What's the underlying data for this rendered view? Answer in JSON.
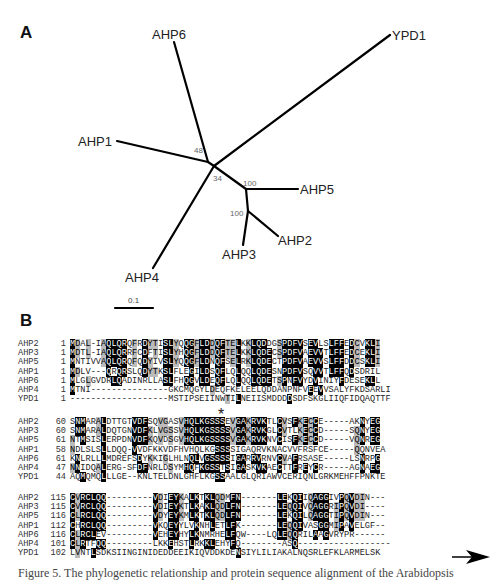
{
  "panel_a": {
    "label": "A",
    "leaves": [
      "AHP6",
      "YPD1",
      "AHP1",
      "AHP5",
      "AHP2",
      "AHP3",
      "AHP4"
    ],
    "bootstrap": [
      "48",
      "34",
      "100",
      "100"
    ],
    "scale_bar": "0.1"
  },
  "panel_b": {
    "label": "B",
    "conserved_marker": "*",
    "blocks": [
      {
        "rows": [
          {
            "name": "AHP2",
            "start": "1",
            "seq": "MDAL-IAQLQRQFRDYTISLYQQGFLDDQFTELKKLQDDGSPDFVSEVLSLFFEDCVKLI"
          },
          {
            "name": "AHP3",
            "start": "1",
            "seq": "MDTL-IAQLQRRFCDFTISLYHQGFLDDQFTELKKLQDECSPDFVAEVVTLFFEDCEKLI"
          },
          {
            "name": "AHP5",
            "start": "1",
            "seq": "MNTIVVAQLQRQFQDYIVSLYQQGFLDNQFSELRKLQDECTPDFVAEVVSLFFDDCSKLI"
          },
          {
            "name": "AHP1",
            "start": "1",
            "seq": "MDLV---QRQRSLQDYTKSLFLEGILDSQFLQLQQLQDESNPDFVSQVVTLFFQDSDRIL"
          },
          {
            "name": "AHP6",
            "start": "1",
            "seq": "MLGLGVDRLQADINRLLASLFHQGVLDEQFLQLQQLQDETSPNFVYDVINIYFDESEKLL"
          },
          {
            "name": "AHP4",
            "start": "1",
            "seq": "MTNI---------------GKCMQGYLDEQFKELEELQDDANPNFVEEVVSALYFKDSARLI"
          },
          {
            "name": "YPD1",
            "start": "1",
            "seq": "-------------------MSTIPSEIINWTILNEIISMDDDDSDFSKGLIIQFIDQAQTTF"
          }
        ]
      },
      {
        "rows": [
          {
            "name": "AHP2",
            "start": "60",
            "seq": "SNMARALDTTGTVDFSQVGASVHQLKGSSSEVGAKRVKTLCVSFKECCE-----AKNYEG"
          },
          {
            "name": "AHP3",
            "start": "60",
            "seq": "SNMARALDQTGNVDFKLVGSSVHQLKGSSSSVGAKRVKGLCVTLKECCD-----SQNYEG"
          },
          {
            "name": "AHP5",
            "start": "61",
            "seq": "NTMSISLERPDNVDFKQVDSGVHQLKGSSSSVGAKRVKNVCISFKECCD-----VQNREG"
          },
          {
            "name": "AHP1",
            "start": "58",
            "seq": "NDLSLSLLDQQ-VVDFKKVDFHVHQLKGSSSSIGAQRVKNACVVFRSFCE-----QQNVEA"
          },
          {
            "name": "AHP6",
            "start": "61",
            "seq": "KNLRLLLMDREFSDYKKIGLHLNQLVGSSSSIGARRVRNVCVAFRSASE-----LSNRPG"
          },
          {
            "name": "AHP4",
            "start": "47",
            "seq": "NNIDQALERG-SFDFNRLDSYMHQFKGSSTSIGASKVKAECTTFREYCR-----AGNAEG"
          },
          {
            "name": "YPD1",
            "start": "44",
            "seq": "AQMQMQLLLGE--KNLTELDNLGHFLKGSSAALGLQRIAWVCERIQNLGRKMEHFFPNKTE"
          }
        ]
      },
      {
        "rows": [
          {
            "name": "AHP2",
            "start": "115",
            "seq": "CVRCLQQ---------VDIEYKALKTKLQDMFN-------LEKQIIQAGGIVPQVDIN---"
          },
          {
            "name": "AHP3",
            "start": "115",
            "seq": "CVRCLQQ---------VDIEYKTLKAKLQDLFN-------LEQQIVQAGGRIPQVDI----"
          },
          {
            "name": "AHP5",
            "start": "116",
            "seq": "CLRCLQQ---------VDYEYKMLKTKLQDLFN-------LEKQILQAGGTIPQVDIN---"
          },
          {
            "name": "AHP1",
            "start": "112",
            "seq": "CHRCLQQ---------VKQEYYLVKNHLETLFK-------LEQQIVASGGMIPAVELGF--"
          },
          {
            "name": "AHP6",
            "start": "116",
            "seq": "CLRCLEV---------VEHEYHYLKNMRHELFQW----LQLEQQRILAAGVRYPR------"
          },
          {
            "name": "AHP4",
            "start": "101",
            "seq": "CLRTFQQ---------LKKEHSTLRKKLEHYFQ--------ASQ------------------"
          },
          {
            "name": "YPD1",
            "start": "102",
            "seq": "LVNTLSDKSIINGINIDEDDEEIKIQVDDKDENSIYLILIAKALNQSRLEFKLARMELSK"
          }
        ]
      }
    ]
  },
  "caption": "Figure 5. The phylogenetic relationship and protein sequence alignment of the Arabidopsis"
}
